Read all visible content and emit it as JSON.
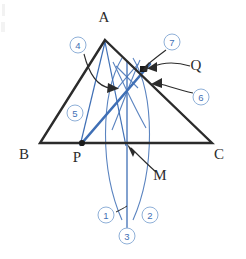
{
  "figure": {
    "colors": {
      "ink": "#2b2b2b",
      "construction_blue": "#3f6fb5",
      "arc_blue": "#5b84c0",
      "circle_outline": "#8fb0d8",
      "background": "#ffffff"
    },
    "vertex_labels": [
      {
        "id": "A",
        "text": "A",
        "x": 104,
        "y": 22
      },
      {
        "id": "B",
        "text": "B",
        "x": 24,
        "y": 159
      },
      {
        "id": "C",
        "text": "C",
        "x": 219,
        "y": 159
      },
      {
        "id": "P",
        "text": "P",
        "x": 77,
        "y": 162
      },
      {
        "id": "Q",
        "text": "Q",
        "x": 196,
        "y": 70
      },
      {
        "id": "M",
        "text": "M",
        "x": 160,
        "y": 180
      }
    ],
    "points": [
      {
        "id": "A",
        "x": 105,
        "y": 40
      },
      {
        "id": "B",
        "x": 40,
        "y": 143
      },
      {
        "id": "C",
        "x": 212,
        "y": 143
      },
      {
        "id": "P",
        "x": 82,
        "y": 143
      },
      {
        "id": "M",
        "x": 127,
        "y": 143
      },
      {
        "id": "Q",
        "x": 143,
        "y": 70
      },
      {
        "id": "X",
        "x": 127,
        "y": 207
      }
    ],
    "marked_points": [
      "P",
      "Q"
    ],
    "steps": [
      {
        "label": "1",
        "x": 106,
        "y": 215
      },
      {
        "label": "2",
        "x": 150,
        "y": 215
      },
      {
        "label": "3",
        "x": 127,
        "y": 236
      },
      {
        "label": "4",
        "x": 78,
        "y": 45
      },
      {
        "label": "5",
        "x": 75,
        "y": 113
      },
      {
        "label": "6",
        "x": 201,
        "y": 97
      },
      {
        "label": "7",
        "x": 172,
        "y": 42
      }
    ]
  }
}
